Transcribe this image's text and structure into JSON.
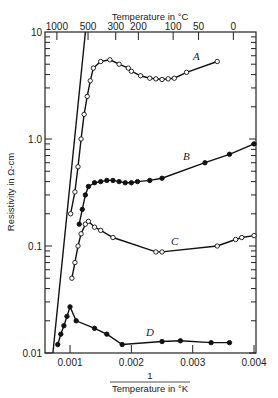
{
  "chart_data": {
    "type": "line",
    "title": "",
    "xlabel": "1 / Temperature in °K",
    "xlabel_numerator": "1",
    "xlabel_denominator": "Temperature in °K",
    "ylabel": "Resistivity in Ω-cm",
    "top_xlabel": "Temperature in °C",
    "xlim": [
      0.0006,
      0.004
    ],
    "ylim": [
      0.01,
      10
    ],
    "yscale": "log",
    "x_ticks": [
      "0.001",
      "0.002",
      "0.003",
      "0.004"
    ],
    "y_ticks": [
      "0.01",
      "0.1",
      "1.0",
      "10"
    ],
    "top_ticks": [
      "1000",
      "500",
      "300",
      "200",
      "100",
      "50",
      "0"
    ],
    "grid": false,
    "series": [
      {
        "name": "A",
        "marker": "open-circle",
        "x": [
          0.00101,
          0.00108,
          0.00113,
          0.00118,
          0.00123,
          0.00128,
          0.00133,
          0.00138,
          0.0015,
          0.00165,
          0.0018,
          0.00195,
          0.002,
          0.00215,
          0.0023,
          0.0024,
          0.0025,
          0.0026,
          0.0027,
          0.0029,
          0.0034
        ],
        "y": [
          0.2,
          0.32,
          0.55,
          1.0,
          1.7,
          2.5,
          3.5,
          4.6,
          5.3,
          5.5,
          5.0,
          4.6,
          4.3,
          3.9,
          3.7,
          3.65,
          3.6,
          3.65,
          3.7,
          4.2,
          5.3
        ]
      },
      {
        "name": "B",
        "marker": "filled-circle",
        "x": [
          0.00115,
          0.0012,
          0.00125,
          0.0013,
          0.0014,
          0.0015,
          0.0016,
          0.0017,
          0.0018,
          0.0019,
          0.002,
          0.0021,
          0.0023,
          0.0025,
          0.0032,
          0.0036,
          0.004
        ],
        "y": [
          0.16,
          0.22,
          0.3,
          0.36,
          0.39,
          0.4,
          0.41,
          0.41,
          0.4,
          0.39,
          0.39,
          0.4,
          0.41,
          0.43,
          0.6,
          0.72,
          0.9
        ]
      },
      {
        "name": "C",
        "marker": "open-circle",
        "x": [
          0.00103,
          0.00108,
          0.00113,
          0.00118,
          0.00125,
          0.0013,
          0.0014,
          0.0015,
          0.0017,
          0.0024,
          0.0025,
          0.0034,
          0.0037,
          0.0038,
          0.004
        ],
        "y": [
          0.05,
          0.07,
          0.1,
          0.13,
          0.16,
          0.17,
          0.15,
          0.14,
          0.12,
          0.088,
          0.088,
          0.1,
          0.115,
          0.12,
          0.125
        ]
      },
      {
        "name": "D",
        "marker": "filled-circle",
        "x": [
          0.0008,
          0.00085,
          0.0009,
          0.00095,
          0.001,
          0.0011,
          0.0014,
          0.0016,
          0.00185,
          0.0025,
          0.0028,
          0.0033,
          0.0036
        ],
        "y": [
          0.012,
          0.015,
          0.018,
          0.022,
          0.027,
          0.02,
          0.017,
          0.015,
          0.012,
          0.0128,
          0.013,
          0.0125,
          0.0125
        ]
      },
      {
        "name": "intrinsic-line",
        "marker": "none",
        "x": [
          0.00072,
          0.00125
        ],
        "y": [
          0.01,
          10
        ]
      }
    ],
    "annotations": [
      "A",
      "B",
      "C",
      "D"
    ]
  }
}
